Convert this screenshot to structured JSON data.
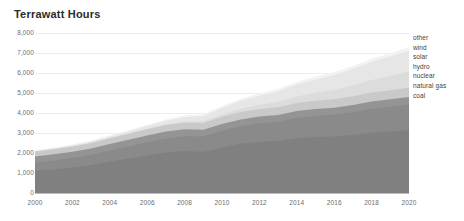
{
  "chart_title": "Terrawatt Hours",
  "axes": {
    "y_ticks": [
      "8,000",
      "7,000",
      "6,000",
      "5,000",
      "4,000",
      "3,000",
      "2,000",
      "1,000",
      "0"
    ],
    "x_ticks": [
      "2000",
      "2002",
      "2004",
      "2006",
      "2008",
      "2010",
      "2012",
      "2014",
      "2016",
      "2018",
      "2020"
    ]
  },
  "legend": {
    "items": [
      {
        "label": "other"
      },
      {
        "label": "wind"
      },
      {
        "label": "solar"
      },
      {
        "label": "hydro"
      },
      {
        "label": "nuclear"
      },
      {
        "label": "natural gas"
      },
      {
        "label": "coal"
      }
    ]
  },
  "chart_data": {
    "type": "area",
    "title": "Terrawatt Hours",
    "xlabel": "",
    "ylabel": "Terrawatt Hours",
    "xlim": [
      2000,
      2020
    ],
    "ylim": [
      0,
      8000
    ],
    "grid": true,
    "legend_position": "right",
    "stacked": true,
    "x": [
      2000,
      2001,
      2002,
      2003,
      2004,
      2005,
      2006,
      2007,
      2008,
      2009,
      2010,
      2011,
      2012,
      2013,
      2014,
      2015,
      2016,
      2017,
      2018,
      2019,
      2020
    ],
    "series": [
      {
        "name": "coal",
        "color": "#808080",
        "values": [
          1100,
          1180,
          1270,
          1400,
          1560,
          1720,
          1880,
          2020,
          2100,
          2060,
          2280,
          2460,
          2560,
          2600,
          2740,
          2800,
          2820,
          2900,
          3020,
          3080,
          3150
        ]
      },
      {
        "name": "natural gas",
        "color": "#8a8a8a",
        "values": [
          420,
          450,
          480,
          510,
          560,
          610,
          660,
          710,
          740,
          760,
          830,
          880,
          930,
          960,
          1010,
          1050,
          1090,
          1140,
          1190,
          1230,
          1270
        ]
      },
      {
        "name": "nuclear",
        "color": "#949494",
        "values": [
          300,
          305,
          310,
          318,
          325,
          330,
          336,
          340,
          342,
          338,
          345,
          340,
          330,
          335,
          345,
          350,
          355,
          360,
          368,
          372,
          378
        ]
      },
      {
        "name": "hydro",
        "color": "#c9c9c9",
        "values": [
          250,
          258,
          266,
          275,
          288,
          300,
          312,
          324,
          334,
          340,
          356,
          368,
          382,
          390,
          404,
          412,
          420,
          432,
          444,
          452,
          462
        ]
      },
      {
        "name": "solar",
        "color": "#dcdcdc",
        "values": [
          5,
          6,
          8,
          11,
          15,
          21,
          30,
          44,
          62,
          86,
          120,
          165,
          215,
          270,
          330,
          395,
          465,
          545,
          630,
          720,
          820
        ]
      },
      {
        "name": "wind",
        "color": "#e6e6e6",
        "values": [
          18,
          26,
          38,
          54,
          74,
          98,
          128,
          165,
          210,
          262,
          320,
          385,
          450,
          520,
          595,
          670,
          745,
          820,
          895,
          965,
          1030
        ]
      },
      {
        "name": "other",
        "color": "#f2f2f2",
        "values": [
          40,
          44,
          48,
          53,
          58,
          64,
          70,
          77,
          84,
          90,
          98,
          106,
          114,
          122,
          130,
          138,
          146,
          154,
          162,
          170,
          178
        ]
      }
    ]
  }
}
